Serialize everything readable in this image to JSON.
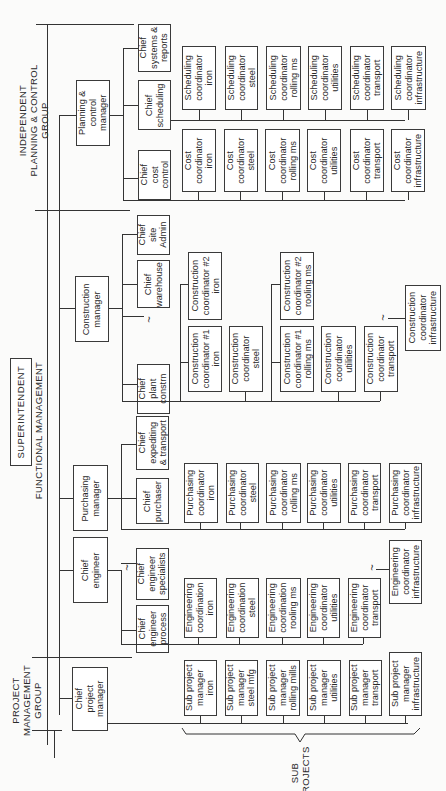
{
  "groups": {
    "project": "PROJECT\nMANAGEMENT\nGROUP",
    "functional": "FUNCTIONAL MANAGEMENT",
    "planning": "INDEPENDENT\nPLANNING & CONTROL\nGROUP",
    "superintendent": "SUPERINTENDENT",
    "subprojects": "SUB\nPROJECTS"
  },
  "managers": {
    "chief_project_manager": "Chief\nproject\nmanager",
    "chief_engineer": "Chief\nengineer",
    "purchasing_manager": "Purchasing\nmanager",
    "construction_manager": "Construction\nmanager",
    "planning_control_manager": "Planning &\ncontrol\nmanager"
  },
  "chiefs": {
    "engineer_process": "Chief\nengineer\nprocess",
    "engineer_specialists": "Chief\nengineer\nspecialists",
    "purchaser": "Chief\npurchaser",
    "expediting": "Chief\nexpediting\n& transport",
    "plant_constrn": "Chief\nplant\nconstrn",
    "warehouse": "Chief\nwarehouse",
    "site_admin": "Chief\nsite\nAdmin",
    "cost_control": "Chief\ncost\ncontrol",
    "scheduling": "Chief\nscheduling",
    "systems_reports": "Chief\nsystems &\nreports"
  },
  "sub_projects": [
    "Sub project\nmanager\niron",
    "Sub project\nmanager\nsteel mfg",
    "Sub project\nmanager\nrolling mills",
    "Sub project\nmanager\nutilities",
    "Sub project\nmanager\ntransport",
    "Sub project\nmanager\ninfrastructure"
  ],
  "engineering": [
    "Engineering\ncoordination\niron",
    "Engineering\ncoordination\nsteel",
    "Engineering\ncoordination\nrooling ms",
    "Engineering\ncoordinator\nutilities",
    "Engineering\ncoordinator\ntransport",
    "Engineering\ncoordinator\ninfrastructure"
  ],
  "purchasing": [
    "Purchasing\ncoordinator\niron",
    "Purchasing\ncoordinator\nsteel",
    "Purchasing\ncoordinator\nrolling ms",
    "Purchasing\ncoordinator\nutilities",
    "Purchasing\ncoordinator\ntransport",
    "Purchasing\ncoordinator\ninfrastructure"
  ],
  "construction": {
    "c1_iron": "Construction\ncoordinator #1\niron",
    "c2_iron": "Construction\ncoordinator #2\niron",
    "steel": "Construction\ncoordinator\nsteel",
    "c1_rolling": "Construction\ncoordinator #1\nrolling ms",
    "c2_rolling": "Construction\ncoordinator #2\nrooling ms",
    "utilities": "Construction\ncoordinator\nutilities",
    "transport": "Construction\ncoordinator\ntransport",
    "infrastructure": "Construction\ncoordinator\ninfrastructure"
  },
  "cost": [
    "Cost\ncoordinator\niron",
    "Cost\ncoordinator\nsteel",
    "Cost\ncoordinator\nrolling ms",
    "Cost\ncoordinator\nutilities",
    "Cost\ncoordinator\ntransport",
    "Cost\ncoordinator\ninfrastructure"
  ],
  "scheduling": [
    "Scheduling\ncoordinator\niron",
    "Scheduling\ncoordinator\nsteel",
    "Scheduling\ncoordinator\nrolling ms",
    "Scheduling\ncoordinator\nutilities",
    "Scheduling\ncoordinator\ntransport",
    "Scheduling\ncoordinator\ninfrastructure"
  ]
}
